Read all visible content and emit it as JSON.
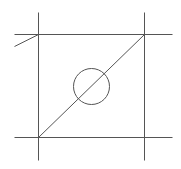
{
  "diagram": {
    "background": "#ffffff",
    "stroke_color": "#555555",
    "stroke_width": 1,
    "lines": [
      {
        "name": "left-vertical-line",
        "x1": 38,
        "y1": 12,
        "x2": 38,
        "y2": 160
      },
      {
        "name": "right-vertical-line",
        "x1": 144,
        "y1": 12,
        "x2": 144,
        "y2": 160
      },
      {
        "name": "top-horizontal-line",
        "x1": 14,
        "y1": 34,
        "x2": 172,
        "y2": 34
      },
      {
        "name": "bottom-horizontal-line",
        "x1": 14,
        "y1": 137,
        "x2": 172,
        "y2": 137
      },
      {
        "name": "diagonal-line",
        "x1": 38,
        "y1": 137,
        "x2": 144,
        "y2": 34
      },
      {
        "name": "slant-stub-line",
        "x1": 14,
        "y1": 46,
        "x2": 38,
        "y2": 34
      }
    ],
    "circles": [
      {
        "name": "center-circle",
        "cx": 91,
        "cy": 86,
        "r": 18
      }
    ]
  }
}
